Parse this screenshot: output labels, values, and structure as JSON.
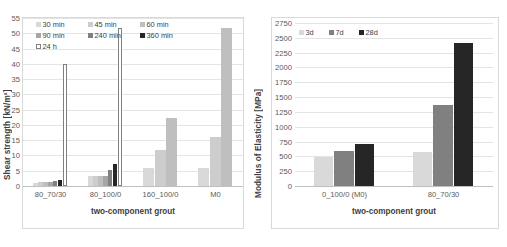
{
  "figure": {
    "background": "#ffffff"
  },
  "chart_data": [
    {
      "id": "shear-strength",
      "type": "bar",
      "title": "",
      "xlabel": "two-component grout",
      "ylabel": "Shear strength [kN/m²]",
      "categories": [
        "80_70/30",
        "80_100/0",
        "160_100/0",
        "M0"
      ],
      "ylim": [
        0,
        55
      ],
      "yticks": [
        0,
        5,
        10,
        15,
        20,
        25,
        30,
        35,
        40,
        45,
        50,
        55
      ],
      "grid": true,
      "legend_position": "top-inside",
      "series": [
        {
          "name": "30 min",
          "color": "#d9d9d9",
          "values": [
            1.0,
            3.3,
            5.8,
            5.9
          ]
        },
        {
          "name": "45 min",
          "color": "#cdcdcd",
          "values": [
            1.2,
            3.3,
            11.9,
            16.2
          ]
        },
        {
          "name": "60 min",
          "color": "#bfbfbf",
          "values": [
            1.3,
            3.4,
            22.3,
            51.8
          ]
        },
        {
          "name": "90 min",
          "color": "#a6a6a6",
          "values": [
            1.4,
            3.4,
            null,
            null
          ]
        },
        {
          "name": "240 min",
          "color": "#808080",
          "values": [
            1.6,
            5.2,
            null,
            null
          ]
        },
        {
          "name": "360 min",
          "color": "#262626",
          "values": [
            1.9,
            7.1,
            null,
            null
          ]
        },
        {
          "name": "24 h",
          "color": "#ffffff",
          "values": [
            40.0,
            51.8,
            null,
            null
          ]
        }
      ]
    },
    {
      "id": "modulus-of-elasticity",
      "type": "bar",
      "title": "",
      "xlabel": "two-component grout",
      "ylabel": "Modulus of Elasticity [MPa]",
      "categories": [
        "0_100/0 (M0)",
        "80_70/30"
      ],
      "ylim": [
        0,
        2750
      ],
      "yticks": [
        0,
        250,
        500,
        750,
        1000,
        1250,
        1500,
        1750,
        2000,
        2250,
        2500,
        2750
      ],
      "grid": true,
      "legend_position": "top-inside",
      "series": [
        {
          "name": "3d",
          "color": "#d9d9d9",
          "values": [
            490,
            570
          ]
        },
        {
          "name": "7d",
          "color": "#808080",
          "values": [
            595,
            1370
          ]
        },
        {
          "name": "28d",
          "color": "#262626",
          "values": [
            710,
            2420
          ]
        }
      ]
    }
  ]
}
